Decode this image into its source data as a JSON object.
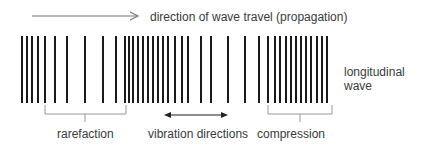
{
  "diagram": {
    "title_arrow_label": "direction of wave travel (propagation)",
    "side_label_line1": "longitudinal",
    "side_label_line2": "wave",
    "bracket_labels": {
      "rarefaction": "rarefaction",
      "compression": "compression"
    },
    "vibration_label": "vibration directions",
    "colors": {
      "bars": "#1a1a1a",
      "lines": "#888888",
      "text": "#3a3a3a",
      "background": "#ffffff"
    },
    "bar_positions_x": [
      22,
      27,
      32,
      38,
      45,
      55,
      67,
      85,
      103,
      116,
      125,
      129,
      133,
      138,
      143,
      148,
      153,
      158,
      163,
      168,
      175,
      182,
      188,
      201,
      211,
      228,
      245,
      259,
      268,
      275,
      280,
      286,
      291,
      296,
      301,
      306,
      311,
      317,
      322,
      327
    ],
    "bar_top_y": 36,
    "bar_bottom_y": 103
  }
}
